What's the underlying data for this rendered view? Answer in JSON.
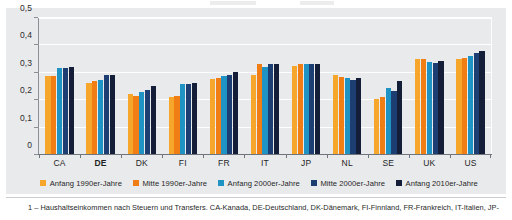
{
  "chart_data": {
    "type": "bar",
    "title": "",
    "xlabel": "",
    "ylabel": "",
    "ylim": [
      0,
      0.5
    ],
    "ytick_labels": [
      "0",
      "0,1",
      "0,2",
      "0,3",
      "0,4",
      "0,5"
    ],
    "ytick_values": [
      0,
      0.1,
      0.2,
      0.3,
      0.4,
      0.5
    ],
    "grid": true,
    "legend_position": "bottom",
    "categories": [
      "CA",
      "DE",
      "DK",
      "FI",
      "FR",
      "IT",
      "JP",
      "NL",
      "SE",
      "UK",
      "US"
    ],
    "highlight_category": "DE",
    "series": [
      {
        "name": "Anfang 1990er-Jahre",
        "color": "#F5A62B",
        "values": [
          0.287,
          0.262,
          0.221,
          0.209,
          0.277,
          0.29,
          0.323,
          0.292,
          0.202,
          0.35,
          0.348
        ]
      },
      {
        "name": "Mitte 1990er-Jahre",
        "color": "#F07E14",
        "values": [
          0.288,
          0.27,
          0.214,
          0.215,
          0.281,
          0.33,
          0.33,
          0.282,
          0.211,
          0.351,
          0.353
        ]
      },
      {
        "name": "Anfang 2000er-Jahre",
        "color": "#1F93C4",
        "values": [
          0.318,
          0.271,
          0.229,
          0.257,
          0.288,
          0.32,
          0.332,
          0.28,
          0.241,
          0.34,
          0.36
        ]
      },
      {
        "name": "Mitte 2000er-Jahre",
        "color": "#1C3E72",
        "values": [
          0.317,
          0.292,
          0.237,
          0.259,
          0.29,
          0.33,
          0.33,
          0.272,
          0.231,
          0.333,
          0.372
        ]
      },
      {
        "name": "Anfang 2010er-Jahre",
        "color": "#141E38",
        "values": [
          0.319,
          0.29,
          0.249,
          0.261,
          0.303,
          0.33,
          0.332,
          0.28,
          0.269,
          0.341,
          0.38
        ]
      }
    ]
  },
  "footnote": {
    "text": "1 – Haushaltseinkommen nach Steuern und Transfers. CA-Kanada, DE-Deutschland, DK-Dänemark, FI-Finnland, FR-Frankreich, IT-Italien, JP-"
  }
}
